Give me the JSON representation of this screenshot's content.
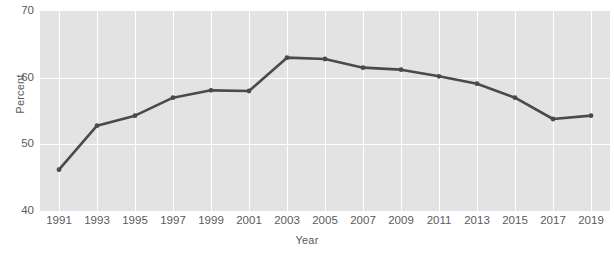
{
  "chart_data": {
    "type": "line",
    "title": "",
    "xlabel": "Year",
    "ylabel": "Percent",
    "x": [
      1991,
      1993,
      1995,
      1997,
      1999,
      2001,
      2003,
      2005,
      2007,
      2009,
      2011,
      2013,
      2015,
      2017,
      2019
    ],
    "values": [
      46.2,
      52.8,
      54.3,
      57.0,
      58.1,
      58.0,
      63.0,
      62.8,
      61.5,
      61.2,
      60.2,
      59.1,
      57.0,
      53.8,
      54.3
    ],
    "xtick_labels": [
      "1991",
      "1993",
      "1995",
      "1997",
      "1999",
      "2001",
      "2003",
      "2005",
      "2007",
      "2009",
      "2011",
      "2013",
      "2015",
      "2017",
      "2019"
    ],
    "ytick_labels": [
      "70",
      "60",
      "50",
      "40"
    ],
    "yticks": [
      70,
      60,
      50,
      40
    ],
    "ylim": [
      40,
      70
    ],
    "xlim": [
      1990,
      2020
    ],
    "grid": true,
    "grid_color": "#ffffff",
    "panel_color": "#e3e3e3",
    "line_color": "#4a4a4a",
    "marker_color": "#4a4a4a",
    "text_color": "#5b5b5b",
    "legend": null,
    "markers": true
  }
}
